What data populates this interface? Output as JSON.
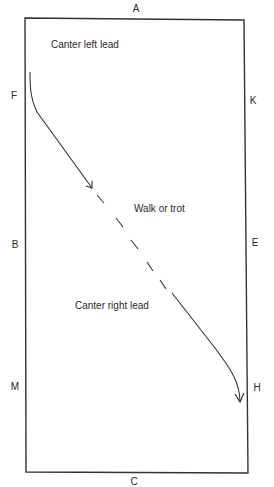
{
  "diagram": {
    "arena": {
      "corners": {
        "top_left": [
          25,
          18
        ],
        "top_right": [
          244,
          20
        ],
        "bottom_right": [
          248,
          473
        ],
        "bottom_left": [
          26,
          472
        ]
      },
      "stroke_color": "#333333"
    },
    "markers": [
      {
        "id": "A",
        "label": "A",
        "x": 136,
        "y": 9
      },
      {
        "id": "F",
        "label": "F",
        "x": 14,
        "y": 96
      },
      {
        "id": "K",
        "label": "K",
        "x": 253,
        "y": 101
      },
      {
        "id": "B",
        "label": "B",
        "x": 15,
        "y": 245
      },
      {
        "id": "E",
        "label": "E",
        "x": 255,
        "y": 243
      },
      {
        "id": "M",
        "label": "M",
        "x": 15,
        "y": 387
      },
      {
        "id": "H",
        "label": "H",
        "x": 257,
        "y": 388
      },
      {
        "id": "C",
        "label": "C",
        "x": 134,
        "y": 482
      }
    ],
    "zone_labels": [
      {
        "id": "canter-left",
        "text": "Canter left lead",
        "x": 51,
        "y": 45
      },
      {
        "id": "walk-trot",
        "text": "Walk or trot",
        "x": 134,
        "y": 204
      },
      {
        "id": "canter-right",
        "text": "Canter right lead",
        "x": 75,
        "y": 302
      }
    ],
    "path": {
      "segment_1": "canter left lead, solid, from F curving down-right with arrow",
      "segment_2": "walk or trot, dashed",
      "segment_3": "canter right lead, solid, curving down to H with arrow",
      "stroke_color": "#333333"
    }
  }
}
